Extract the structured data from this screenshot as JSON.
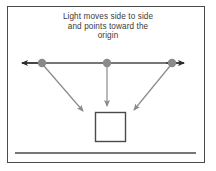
{
  "figure": {
    "caption_lines": [
      "Light moves side to side",
      "and points toward the",
      "origin"
    ],
    "caption_text": "Light moves side to side\nand points toward the\norigin",
    "colors": {
      "border": "#4a4a4a",
      "axis_line": "#4a4a4a",
      "arrow_head": "#2b2b2b",
      "dot": "#8a8a8a",
      "ray": "#8a8a8a",
      "box_outline": "#4a4a4a",
      "ground_line": "#4a4a4a",
      "background": "#ffffff",
      "caption_text": "#3b3b3b"
    },
    "geometry": {
      "frame": {
        "x": 7,
        "y": 6,
        "width": 198,
        "height": 157
      },
      "axis": {
        "y": 63,
        "x_start": 16,
        "x_end": 190
      },
      "dots": [
        {
          "name": "left-light-source",
          "x": 42,
          "y": 63,
          "r": 4.2
        },
        {
          "name": "center-light-source",
          "x": 107,
          "y": 63,
          "r": 4.2
        },
        {
          "name": "right-light-source",
          "x": 172,
          "y": 63,
          "r": 4.2
        }
      ],
      "rays": [
        {
          "name": "left-ray",
          "x1": 44,
          "y1": 66,
          "x2": 85,
          "y2": 114
        },
        {
          "name": "center-ray",
          "x1": 107,
          "y1": 67,
          "x2": 107,
          "y2": 110
        },
        {
          "name": "right-ray",
          "x1": 170,
          "y1": 66,
          "x2": 132,
          "y2": 114
        }
      ],
      "box": {
        "x": 95,
        "y": 112,
        "width": 31,
        "height": 30
      },
      "ground_line": {
        "y": 153,
        "x_start": 15,
        "x_end": 196
      }
    }
  }
}
